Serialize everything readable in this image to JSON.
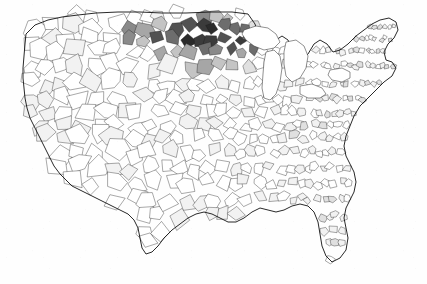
{
  "figure": {
    "kind": "choropleth-map",
    "region": "Contiguous United States",
    "unit": "county",
    "title": "",
    "subtitle": "",
    "legend": "",
    "axis_labels": "",
    "annotations": "",
    "background_color": "#fefefe",
    "border_color": "#1a1a1a",
    "projection_hint": "albers-usa"
  },
  "chart_data": {
    "type": "heatmap",
    "title": "",
    "xlabel": "",
    "ylabel": "",
    "legend_position": "none",
    "grid": false,
    "color_scale": {
      "name": "grayscale-sequential",
      "low": "#ffffff",
      "high": "#2b2b2b",
      "steps": [
        "#ffffff",
        "#f2f2f2",
        "#e0e0e0",
        "#c4c4c4",
        "#a6a6a6",
        "#8a8a8a",
        "#6d6d6d",
        "#525252",
        "#3b3b3b",
        "#2b2b2b"
      ]
    },
    "categories": [
      "Pacific Northwest",
      "California",
      "Great Basin",
      "Southwest",
      "Northern Rockies / Montana",
      "Dakotas",
      "Northern Minnesota",
      "Great Plains",
      "Texas",
      "Corn Belt",
      "Great Lakes",
      "Ohio Valley",
      "Appalachia",
      "Southeast",
      "Gulf Coast",
      "Florida",
      "Mid-Atlantic",
      "New England"
    ],
    "values": [
      12,
      10,
      8,
      7,
      55,
      82,
      74,
      22,
      9,
      18,
      20,
      16,
      15,
      11,
      10,
      9,
      14,
      13
    ],
    "value_range": [
      0,
      100
    ]
  },
  "map_features": {
    "lakes_drawn_white": [
      "Lake Superior",
      "Lake Michigan",
      "Lake Huron",
      "Lake Erie",
      "Lake Ontario"
    ],
    "visible_landmarks": [
      "Florida peninsula",
      "Cape Cod",
      "Long Island",
      "Chesapeake Bay",
      "Puget Sound",
      "Michigan Upper Peninsula"
    ]
  }
}
